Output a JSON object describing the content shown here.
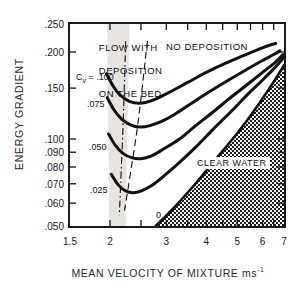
{
  "chart_data": {
    "type": "line",
    "title": "",
    "xlabel": "MEAN VELOCITY OF MIXTURE  ms-1",
    "ylabel": "ENERGY GRADIENT",
    "xscale": "log",
    "yscale": "log",
    "xlim": [
      1.5,
      7
    ],
    "ylim": [
      0.05,
      0.25
    ],
    "grid": false,
    "legend": "inline-curve-labels",
    "xticks": [
      {
        "value": 1.5,
        "label": "1.5"
      },
      {
        "value": 2,
        "label": "2"
      },
      {
        "value": 3,
        "label": "3"
      },
      {
        "value": 4,
        "label": "4"
      },
      {
        "value": 5,
        "label": "5"
      },
      {
        "value": 6,
        "label": "6"
      },
      {
        "value": 7,
        "label": "7"
      }
    ],
    "xminorticks": [
      2.5,
      3.5,
      4.5,
      5.5,
      6.5
    ],
    "yticks": [
      {
        "value": 0.25,
        "label": ".250"
      },
      {
        "value": 0.2,
        "label": ".200"
      },
      {
        "value": 0.15,
        "label": ".150"
      },
      {
        "value": 0.1,
        "label": ".100"
      },
      {
        "value": 0.09,
        "label": ".090"
      },
      {
        "value": 0.08,
        "label": ".080"
      },
      {
        "value": 0.07,
        "label": ".070"
      },
      {
        "value": 0.06,
        "label": ".060"
      },
      {
        "value": 0.05,
        "label": ".050"
      }
    ],
    "series": [
      {
        "name": "Cv = .100",
        "label": "C",
        "label_sub": "v",
        "label_rest": " = .100",
        "label_full": "Cv = .100",
        "points": [
          [
            1.95,
            0.168
          ],
          [
            2.05,
            0.152
          ],
          [
            2.15,
            0.142
          ],
          [
            2.3,
            0.135
          ],
          [
            2.45,
            0.133
          ],
          [
            2.6,
            0.134
          ],
          [
            2.8,
            0.138
          ],
          [
            3.1,
            0.146
          ],
          [
            3.5,
            0.157
          ],
          [
            4.0,
            0.17
          ],
          [
            4.6,
            0.183
          ],
          [
            5.2,
            0.194
          ],
          [
            5.8,
            0.204
          ],
          [
            6.3,
            0.211
          ],
          [
            6.6,
            0.214
          ]
        ]
      },
      {
        "name": "Cv = .075",
        "label_full": ".075",
        "points": [
          [
            1.96,
            0.139
          ],
          [
            2.06,
            0.126
          ],
          [
            2.18,
            0.117
          ],
          [
            2.32,
            0.112
          ],
          [
            2.48,
            0.11
          ],
          [
            2.65,
            0.111
          ],
          [
            2.9,
            0.115
          ],
          [
            3.2,
            0.122
          ],
          [
            3.6,
            0.133
          ],
          [
            4.1,
            0.146
          ],
          [
            4.7,
            0.16
          ],
          [
            5.3,
            0.173
          ],
          [
            5.9,
            0.185
          ],
          [
            6.5,
            0.196
          ],
          [
            6.8,
            0.202
          ]
        ]
      },
      {
        "name": "Cv = .050",
        "label_full": ".050",
        "points": [
          [
            1.98,
            0.104
          ],
          [
            2.08,
            0.095
          ],
          [
            2.2,
            0.089
          ],
          [
            2.35,
            0.086
          ],
          [
            2.5,
            0.0855
          ],
          [
            2.7,
            0.0875
          ],
          [
            2.95,
            0.0925
          ],
          [
            3.3,
            0.1
          ],
          [
            3.7,
            0.111
          ],
          [
            4.2,
            0.124
          ],
          [
            4.8,
            0.14
          ],
          [
            5.4,
            0.155
          ],
          [
            6.0,
            0.17
          ],
          [
            6.6,
            0.185
          ],
          [
            6.95,
            0.196
          ]
        ]
      },
      {
        "name": "Cv = .025",
        "label_full": ".025",
        "points": [
          [
            2.02,
            0.0755
          ],
          [
            2.12,
            0.0695
          ],
          [
            2.22,
            0.0665
          ],
          [
            2.35,
            0.0652
          ],
          [
            2.5,
            0.066
          ],
          [
            2.7,
            0.069
          ],
          [
            2.95,
            0.0745
          ],
          [
            3.3,
            0.083
          ],
          [
            3.7,
            0.0935
          ],
          [
            4.2,
            0.108
          ],
          [
            4.8,
            0.125
          ],
          [
            5.4,
            0.143
          ],
          [
            6.0,
            0.16
          ],
          [
            6.6,
            0.178
          ],
          [
            7.0,
            0.192
          ]
        ]
      },
      {
        "name": "0",
        "label_full": "0",
        "points": [
          [
            2.78,
            0.05
          ],
          [
            3.2,
            0.0585
          ],
          [
            3.7,
            0.07
          ],
          [
            4.2,
            0.083
          ],
          [
            4.8,
            0.099
          ],
          [
            5.4,
            0.117
          ],
          [
            6.0,
            0.138
          ],
          [
            6.6,
            0.162
          ],
          [
            7.0,
            0.18
          ]
        ]
      }
    ],
    "limit_deposit_lines": [
      {
        "name": "dash-dot-limit",
        "style": "dash-dot",
        "points": [
          [
            2.24,
            0.2185
          ],
          [
            2.2,
            0.115
          ],
          [
            2.16,
            0.07
          ],
          [
            2.14,
            0.0545
          ]
        ]
      },
      {
        "name": "dashed-limit",
        "style": "dashed",
        "points": [
          [
            2.62,
            0.2185
          ],
          [
            2.45,
            0.115
          ],
          [
            2.3,
            0.072
          ],
          [
            2.22,
            0.0565
          ]
        ]
      }
    ],
    "shaded_band": {
      "name": "transition-band",
      "color": "#e3e1de",
      "x_range_top": [
        1.96,
        2.3
      ],
      "x_range_bottom": [
        1.99,
        2.24
      ]
    },
    "hatched_region": {
      "name": "clear-water-region",
      "pattern": "checkerboard",
      "label": "CLEAR WATER"
    },
    "annotations": [
      {
        "name": "flow-with-deposition",
        "text": "FLOW WITH\nDEPOSITION\nON THE BED",
        "x": 1.72,
        "y": 0.232
      },
      {
        "name": "no-deposition",
        "text": "NO DEPOSITION",
        "x": 3.15,
        "y": 0.222
      },
      {
        "name": "clear-water",
        "text": "CLEAR WATER",
        "x": 5.0,
        "y": 0.073
      }
    ]
  },
  "labels": {
    "ylabel": "ENERGY GRADIENT",
    "xlabel_main": "MEAN VELOCITY OF MIXTURE  ms",
    "xlabel_sup": "-1",
    "region_flow": "FLOW WITH",
    "region_flow2": "DEPOSITION",
    "region_flow3": "ON THE BED",
    "region_nodep": "NO DEPOSITION",
    "region_clearwater": "CLEAR WATER",
    "cv_label_c": "C",
    "cv_label_sub": "v",
    "cv_label_eq": " = .100",
    "cv_075": ".075",
    "cv_050": ".050",
    "cv_025": ".025",
    "cv_000": "0",
    "y_250": ".250",
    "y_200": ".200",
    "y_150": ".150",
    "y_100": ".100",
    "y_090": ".090",
    "y_080": ".080",
    "y_070": ".070",
    "y_060": ".060",
    "y_050": ".050",
    "x_15": "1.5",
    "x_2": "2",
    "x_3": "3",
    "x_4": "4",
    "x_5": "5",
    "x_6": "6",
    "x_7": "7"
  }
}
